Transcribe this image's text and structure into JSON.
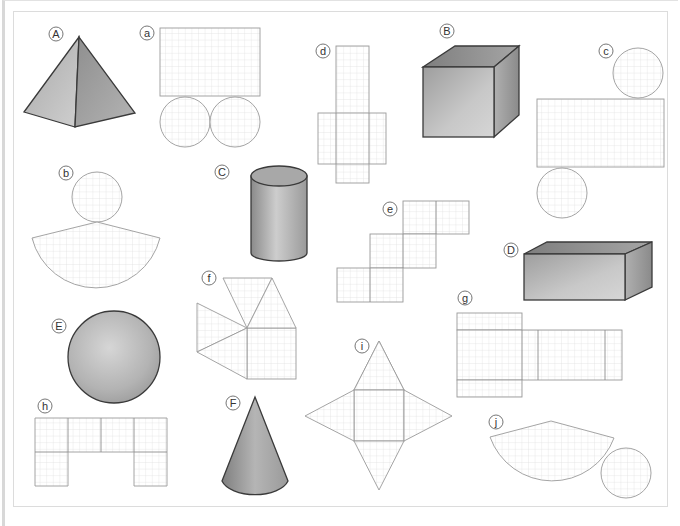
{
  "worksheet": {
    "title_visible": false,
    "solids": [
      {
        "label": "A",
        "name": "square-based pyramid"
      },
      {
        "label": "B",
        "name": "cube"
      },
      {
        "label": "C",
        "name": "cylinder"
      },
      {
        "label": "D",
        "name": "cuboid"
      },
      {
        "label": "E",
        "name": "sphere"
      },
      {
        "label": "F",
        "name": "cone"
      }
    ],
    "nets": [
      {
        "label": "a",
        "description": "rectangle with two circles below"
      },
      {
        "label": "b",
        "description": "circle above a circular sector"
      },
      {
        "label": "c",
        "description": "circle above rectangle, circle below"
      },
      {
        "label": "d",
        "description": "cross-shaped cube net"
      },
      {
        "label": "e",
        "description": "staircase cube net"
      },
      {
        "label": "f",
        "description": "square with four triangles fanned"
      },
      {
        "label": "g",
        "description": "cuboid net"
      },
      {
        "label": "h",
        "description": "arch-shaped net of squares"
      },
      {
        "label": "i",
        "description": "star-shaped pyramid net"
      },
      {
        "label": "j",
        "description": "circular sector beside a circle"
      }
    ]
  },
  "colors": {
    "background": "#ffffff",
    "grid_line": "#d6d6d6",
    "net_outline": "#9a9a9a",
    "solid_shading_dark": "#8a8a8a",
    "solid_shading_light": "#d2d2d2",
    "edge": "#3a3a3a"
  }
}
